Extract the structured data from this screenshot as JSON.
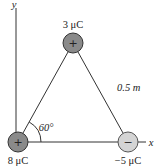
{
  "diagram": {
    "type": "physics-electrostatics",
    "axes": {
      "x_label": "x",
      "y_label": "y"
    },
    "charges": [
      {
        "id": "top",
        "label": "3 μC",
        "value_uC": 3,
        "sign_glyph": "+",
        "fill": "#8a8a8a"
      },
      {
        "id": "origin",
        "label": "8 μC",
        "value_uC": 8,
        "sign_glyph": "+",
        "fill": "#8a8a8a"
      },
      {
        "id": "right",
        "label": "−5 μC",
        "value_uC": -5,
        "sign_glyph": "−",
        "fill": "#d4d4d4"
      }
    ],
    "side_length_label": "0.5 m",
    "angle_label": "60°",
    "colors": {
      "line": "#333333",
      "positive_charge": "#8a8a8a",
      "negative_charge": "#d4d4d4",
      "text": "#222222"
    }
  }
}
